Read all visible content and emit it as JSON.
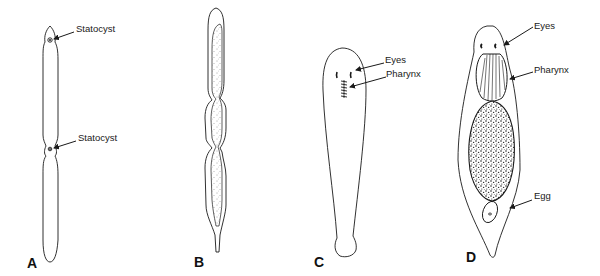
{
  "figure": {
    "panels": [
      {
        "id": "A",
        "letter": "A",
        "labels": [
          "Statocyst",
          "Statocyst"
        ]
      },
      {
        "id": "B",
        "letter": "B",
        "labels": []
      },
      {
        "id": "C",
        "letter": "C",
        "labels": [
          "Eyes",
          "Pharynx"
        ]
      },
      {
        "id": "D",
        "letter": "D",
        "labels": [
          "Eyes",
          "Pharynx",
          "Egg"
        ]
      }
    ]
  },
  "colors": {
    "line": "#1a1a1a",
    "background": "#ffffff"
  }
}
